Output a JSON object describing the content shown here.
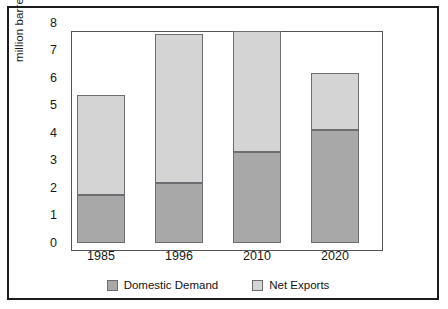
{
  "chart_data": {
    "type": "bar",
    "stacked": true,
    "title": "",
    "subtitle": "",
    "xlabel": "",
    "ylabel": "million barrels per day",
    "categories": [
      "1985",
      "1996",
      "2010",
      "2020"
    ],
    "series": [
      {
        "name": "Domestic Demand",
        "color": "#a8a8a8",
        "values": [
          1.75,
          2.2,
          3.3,
          4.1
        ]
      },
      {
        "name": "Net Exports",
        "color": "#d4d4d4",
        "values": [
          3.65,
          5.4,
          4.4,
          2.1
        ]
      }
    ],
    "totals": [
      5.4,
      7.6,
      7.7,
      6.2
    ],
    "ylim": [
      0,
      8
    ],
    "ytick_labels": [
      "8",
      "7",
      "6",
      "5",
      "4",
      "3",
      "2",
      "1",
      "0"
    ],
    "ytick_values": [
      8,
      7,
      6,
      5,
      4,
      3,
      2,
      1,
      0
    ],
    "grid": false,
    "legend_position": "bottom"
  },
  "axes": {
    "y_title": "million barrels per day"
  },
  "legend": {
    "items": [
      {
        "label": "Domestic Demand",
        "color": "#a8a8a8"
      },
      {
        "label": "Net Exports",
        "color": "#d4d4d4"
      }
    ]
  }
}
